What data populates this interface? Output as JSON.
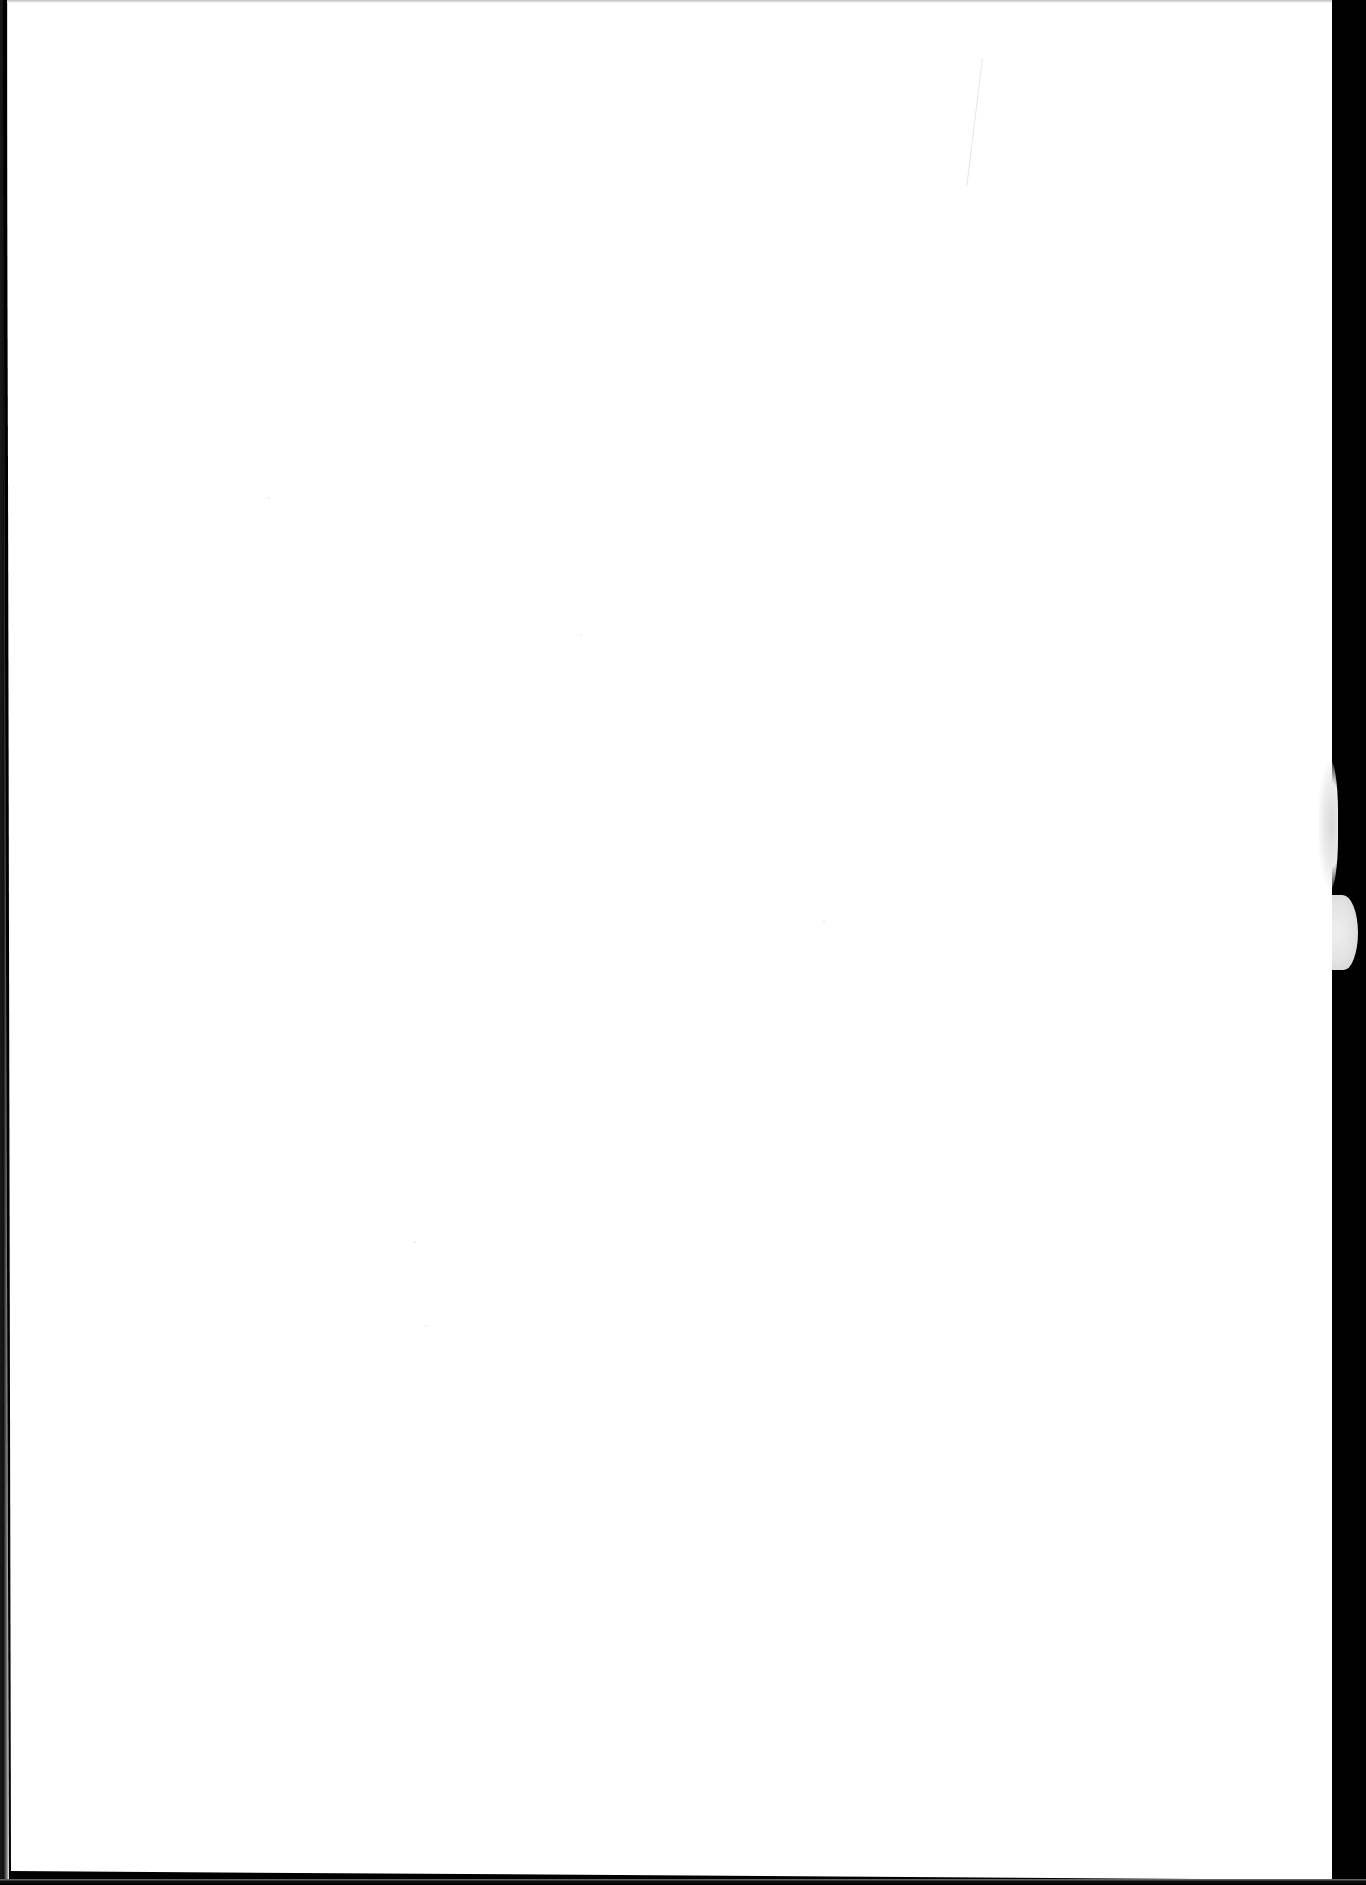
{
  "document": {
    "type": "blank-scanned-page",
    "visible_text": [],
    "colors": {
      "paper": "#ffffff",
      "scan_border": "#000000",
      "smudge": "#d9d9d9",
      "hairline": "#e6e6e6"
    },
    "artifacts": [
      {
        "name": "right-black-strip",
        "description": "dark scanner border along right edge"
      },
      {
        "name": "torn-edge-bump",
        "description": "light paper protrusion into right border"
      },
      {
        "name": "gray-smudge",
        "description": "faint gray mark near right edge"
      },
      {
        "name": "diagonal-hairline",
        "description": "faint pencil-like line near top right"
      },
      {
        "name": "left-dark-edge",
        "description": "thin dark scan edge on left side"
      },
      {
        "name": "bottom-dark-edge",
        "description": "thin dark scan edge at bottom"
      }
    ]
  }
}
